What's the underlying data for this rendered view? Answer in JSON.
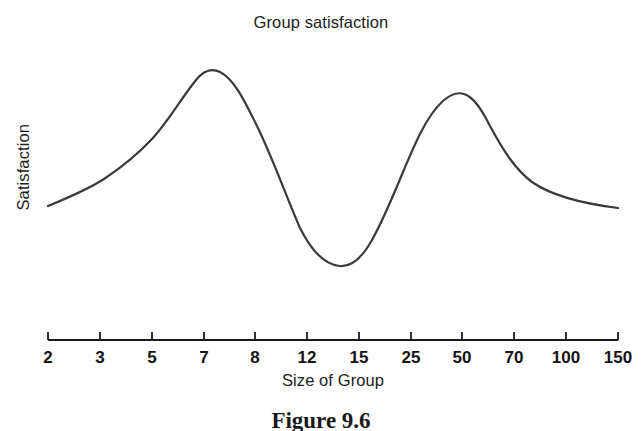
{
  "figure": {
    "caption": "Figure 9.6"
  },
  "chart_data": {
    "type": "line",
    "title": "Group satisfaction",
    "xlabel": "Size of Group",
    "ylabel": "Satisfaction",
    "grid": false,
    "legend": null,
    "x_tick_labels": [
      "2",
      "3",
      "5",
      "7",
      "8",
      "12",
      "15",
      "25",
      "50",
      "70",
      "100",
      "150"
    ],
    "x_tick_positions": [
      48,
      100,
      152,
      204,
      255,
      307,
      359,
      411,
      462,
      514,
      566,
      618
    ],
    "y_axis_visible": false,
    "y_tick_labels": [],
    "series": [
      {
        "name": "Satisfaction",
        "categories": [
          "2",
          "3",
          "5",
          "7",
          "8",
          "12",
          "15",
          "25",
          "50",
          "70",
          "100",
          "150"
        ],
        "values": [
          0.38,
          0.47,
          0.74,
          1.0,
          0.94,
          0.3,
          0.01,
          0.49,
          0.93,
          0.73,
          0.5,
          0.37
        ],
        "annotations": [
          {
            "label": "first peak",
            "x": "7",
            "value": 1.0
          },
          {
            "label": "trough",
            "x": "14",
            "value": 0.01
          },
          {
            "label": "second peak",
            "x": "50",
            "value": 0.93
          }
        ]
      }
    ],
    "curve_path": "M48,206 C70,197 90,188 104,179 C122,167 136,156 152,139 C168,122 180,100 196,80 C204,70 212,68 220,72 C234,79 244,100 256,124 C272,156 286,196 300,228 C312,252 326,265 340,266 C352,267 362,258 372,240 C390,208 404,166 420,134 C436,102 452,90 464,94 C474,97 482,110 490,126 C504,152 516,170 532,182 C552,196 586,204 618,208",
    "stroke_color": "#3a3a3a",
    "stroke_width": 2.2,
    "axis_color": "#1a1a1a",
    "background": "#ffffff"
  }
}
